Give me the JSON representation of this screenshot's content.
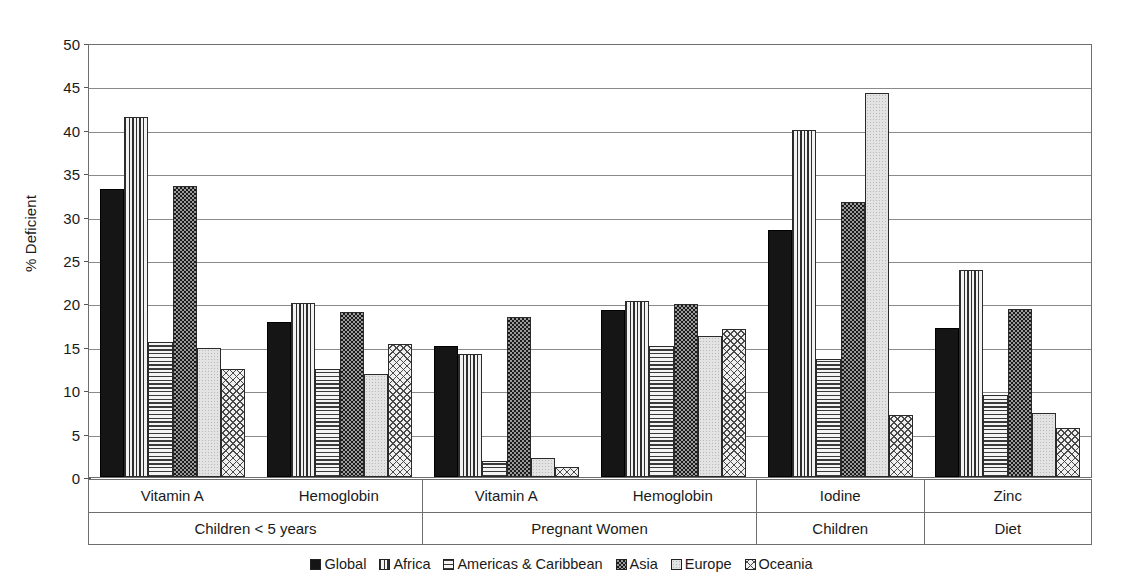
{
  "chart_data": {
    "type": "bar",
    "title": "",
    "xlabel": "",
    "ylabel": "% Deficient",
    "ylim": [
      0,
      50
    ],
    "ytick_step": 5,
    "yticks": [
      "0",
      "5",
      "10",
      "15",
      "20",
      "25",
      "30",
      "35",
      "40",
      "45",
      "50"
    ],
    "grid": true,
    "legend_position": "bottom",
    "categories": [
      "Vitamin A",
      "Hemoglobin",
      "Vitamin A",
      "Hemoglobin",
      "Iodine",
      "Zinc"
    ],
    "supergroups": [
      {
        "label": "Children < 5 years",
        "span": 2
      },
      {
        "label": "Pregnant Women",
        "span": 2
      },
      {
        "label": "Children",
        "span": 1
      },
      {
        "label": "Diet",
        "span": 1
      }
    ],
    "series": [
      {
        "name": "Global",
        "pattern": "solid-black",
        "values": [
          33.2,
          17.9,
          15.1,
          19.2,
          28.5,
          17.2
        ]
      },
      {
        "name": "Africa",
        "pattern": "vertical-lines",
        "values": [
          41.5,
          20.1,
          14.2,
          20.3,
          40.0,
          23.9
        ]
      },
      {
        "name": "Americas & Caribbean",
        "pattern": "horizontal-lines",
        "values": [
          15.6,
          12.5,
          1.9,
          15.1,
          13.6,
          9.5
        ]
      },
      {
        "name": "Asia",
        "pattern": "checkerboard",
        "values": [
          33.5,
          19.0,
          18.4,
          19.9,
          31.7,
          19.4
        ]
      },
      {
        "name": "Europe",
        "pattern": "light-dotted",
        "values": [
          14.9,
          11.9,
          2.2,
          16.2,
          44.2,
          7.4
        ]
      },
      {
        "name": "Oceania",
        "pattern": "cross-hatch",
        "values": [
          12.5,
          15.3,
          1.2,
          17.1,
          7.1,
          5.6
        ]
      }
    ]
  },
  "colors": {
    "axis": "#6e6e6e",
    "grid": "#8a8a8a",
    "text": "#1a1a1a",
    "global": "#151515",
    "europe": "#e3e3e3"
  }
}
